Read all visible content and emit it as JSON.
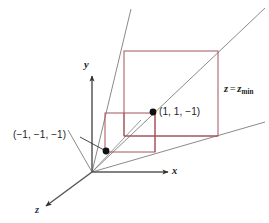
{
  "figure": {
    "background_color": "#ffffff",
    "width": 269,
    "height": 223
  },
  "axes": {
    "x_label": "x",
    "y_label": "y",
    "z_label": "z",
    "axis_color": "#58585a",
    "z_label_color": "#2c3a66",
    "origin": {
      "x": 92,
      "y": 172
    }
  },
  "labels": {
    "near_corner": "(−1, −1, −1)",
    "far_corner": "(1, 1, −1)",
    "plane_prefix": "z",
    "plane_equals": "=",
    "plane_var": "z",
    "plane_subscript": "min"
  },
  "planes": {
    "plane_color": "#a4545c",
    "near_plane": {
      "left": 105,
      "top": 113,
      "right": 155,
      "bottom": 152
    },
    "far_plane": {
      "left": 124,
      "top": 51,
      "right": 218,
      "bottom": 136
    }
  },
  "points": [
    {
      "name": "near-corner-point",
      "x": 106,
      "y": 151,
      "value": "(−1, −1, −1)"
    },
    {
      "name": "far-corner-point",
      "x": 153,
      "y": 112,
      "value": "(1, 1, −1)"
    }
  ],
  "rays": {
    "ray_color": "#7d7d80",
    "count": 3
  }
}
